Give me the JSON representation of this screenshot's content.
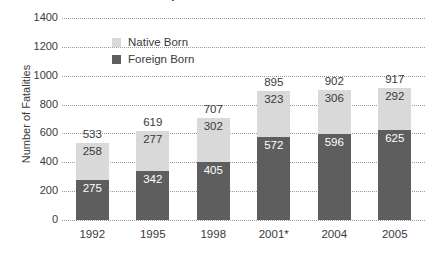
{
  "chart_data": {
    "type": "bar",
    "subtype": "stacked-vertical",
    "title": "US Workplace Fatalities 1992-2005",
    "xlabel": "",
    "ylabel": "Number of Fatalities",
    "ylim": [
      0,
      1400
    ],
    "ytick_labels": [
      "1400",
      "1200",
      "1000",
      "800",
      "600",
      "400",
      "200",
      "0"
    ],
    "ytick_values": [
      1400,
      1200,
      1000,
      800,
      600,
      400,
      200,
      0
    ],
    "grid": "horizontal-dotted",
    "legend_position": "inside-top-left",
    "categories": [
      "1992",
      "1995",
      "1998",
      "2001*",
      "2004",
      "2005"
    ],
    "series": [
      {
        "name": "Native Born",
        "color": "#d9d9d9",
        "values": [
          258,
          277,
          302,
          323,
          306,
          292
        ]
      },
      {
        "name": "Foreign Born",
        "color": "#5e5e5e",
        "values": [
          275,
          342,
          405,
          572,
          596,
          625
        ]
      }
    ],
    "totals": [
      533,
      619,
      707,
      895,
      902,
      917
    ],
    "annotations": [
      "2001* excludes fatalities from the September 11 terrorist attacks"
    ]
  },
  "legend": {
    "items": [
      {
        "label": "Native Born",
        "swatch": "native"
      },
      {
        "label": "Foreign Born",
        "swatch": "foreign"
      }
    ]
  },
  "colors": {
    "native_born": "#d9d9d9",
    "foreign_born": "#5e5e5e",
    "text": "#3a3a3a",
    "gridline": "#9a9a9a",
    "background": "#ffffff"
  }
}
